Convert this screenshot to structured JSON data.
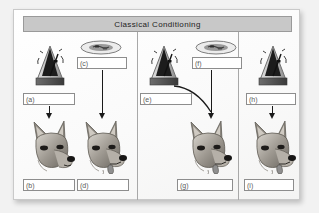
{
  "diagram": {
    "title": "Classical Conditioning",
    "type": "worksheet",
    "panels": [
      {
        "name": "panel-1",
        "stimulus_icon": "metronome-icon",
        "reward_icon": null,
        "dogs": [
          "dog-neutral",
          "dog-salivating"
        ],
        "blanks": [
          {
            "id": "a",
            "label": "(a)",
            "value": ""
          },
          {
            "id": "b",
            "label": "(b)",
            "value": ""
          },
          {
            "id": "c",
            "label": "(c)",
            "value": ""
          },
          {
            "id": "d",
            "label": "(d)",
            "value": ""
          }
        ]
      },
      {
        "name": "panel-2",
        "stimulus_icon": "metronome-icon",
        "reward_icon": "food-icon",
        "dogs": [
          "dog-salivating"
        ],
        "blanks": [
          {
            "id": "e",
            "label": "(e)",
            "value": ""
          },
          {
            "id": "f",
            "label": "(f)",
            "value": ""
          },
          {
            "id": "g",
            "label": "(g)",
            "value": ""
          }
        ]
      },
      {
        "name": "panel-3",
        "stimulus_icon": "metronome-icon",
        "reward_icon": null,
        "dogs": [
          "dog-salivating"
        ],
        "blanks": [
          {
            "id": "h",
            "label": "(h)",
            "value": ""
          },
          {
            "id": "i",
            "label": "(i)",
            "value": ""
          }
        ]
      }
    ],
    "icons": {
      "metronome": "metronome-icon",
      "food": "food-bowl-icon",
      "dog": "german-shepherd-icon",
      "arrow": "down-arrow-icon",
      "curved_arrow": "curved-arrow-icon"
    },
    "colors": {
      "title_bar": "#c8c8c8",
      "border": "#8d8d8d",
      "arrow": "#1a1a1a",
      "paper": "#fbfbfa"
    }
  }
}
